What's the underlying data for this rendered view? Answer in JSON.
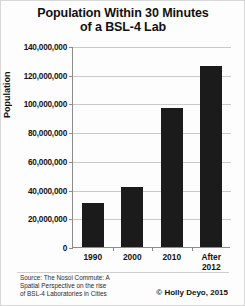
{
  "chart_data": {
    "type": "bar",
    "title": "Population Within 30 Minutes of a BSL-4 Lab",
    "title_line1": "Population Within 30 Minutes",
    "title_line2": "of a BSL-4 Lab",
    "categories": [
      "1990",
      "2000",
      "2010",
      "After 2012"
    ],
    "category_labels": [
      {
        "line1": "1990",
        "line2": ""
      },
      {
        "line1": "2000",
        "line2": ""
      },
      {
        "line1": "2010",
        "line2": ""
      },
      {
        "line1": "After",
        "line2": "2012"
      }
    ],
    "values": [
      31000000,
      42000000,
      97000000,
      126000000
    ],
    "xlabel": "",
    "ylabel": "Population",
    "ylim": [
      0,
      140000000
    ],
    "ytick_values": [
      0,
      20000000,
      40000000,
      60000000,
      80000000,
      100000000,
      120000000,
      140000000
    ],
    "ytick_labels": [
      "0",
      "20,000,000",
      "40,000,000",
      "60,000,000",
      "80,000,000",
      "100,000,000",
      "120,000,000",
      "140,000,000"
    ],
    "grid": true,
    "legend": false,
    "bar_color": "#1b1b1b",
    "gridline_color": "#c9c9c9",
    "axis_color": "#8c8c8c",
    "background_color": "#fdfdfd"
  },
  "source": {
    "line1": "Source: The Nosoi Commute: A",
    "line2": "Spatial Perspective on the rise",
    "line3": "of BSL-4 Laboratories in Cities"
  },
  "copyright": {
    "text": "© Holly Deyo, 2015"
  }
}
